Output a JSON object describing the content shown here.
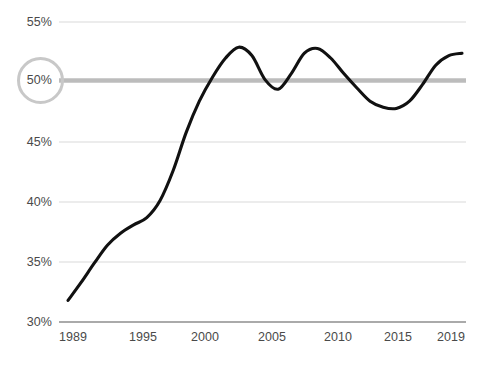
{
  "chart_data": {
    "type": "line",
    "title": "",
    "subtitle": "",
    "xlabel": "",
    "ylabel": "",
    "xlim": [
      1989,
      2019
    ],
    "ylim": [
      30,
      55
    ],
    "grid": true,
    "legend_position": "none",
    "y_ticks": [
      30,
      35,
      40,
      45,
      50,
      55
    ],
    "y_tick_labels": [
      "30%",
      "35%",
      "40%",
      "45%",
      "50%",
      "55%"
    ],
    "x_ticks": [
      1989,
      1995,
      2000,
      2005,
      2010,
      2015,
      2019
    ],
    "x_tick_labels": [
      "1989",
      "1995",
      "2000",
      "2005",
      "2010",
      "2015",
      "2019"
    ],
    "highlight": {
      "value": 50,
      "label": "50%",
      "line_color": "#bcbcbc",
      "ring_color": "#c8c8c8"
    },
    "series": [
      {
        "name": "Share",
        "color": "#111111",
        "x": [
          1989,
          1990,
          1991,
          1992,
          1993,
          1994,
          1995,
          1996,
          1997,
          1998,
          1999,
          2000,
          2001,
          2002,
          2003,
          2004,
          2005,
          2006,
          2007,
          2008,
          2009,
          2010,
          2011,
          2012,
          2013,
          2014,
          2015,
          2016,
          2017,
          2018,
          2019
        ],
        "values": [
          31.8,
          33.3,
          34.9,
          36.4,
          37.4,
          38.1,
          38.7,
          40.1,
          42.6,
          45.8,
          48.4,
          50.4,
          52.0,
          52.9,
          52.2,
          50.2,
          49.4,
          50.7,
          52.4,
          52.8,
          52.0,
          50.7,
          49.5,
          48.4,
          47.9,
          47.8,
          48.4,
          49.8,
          51.4,
          52.2,
          52.4
        ]
      }
    ]
  },
  "axis_colors": {
    "gridline": "#e6e6e6",
    "baseline": "#8e8e8e",
    "tick_text": "#4a4a4a"
  }
}
